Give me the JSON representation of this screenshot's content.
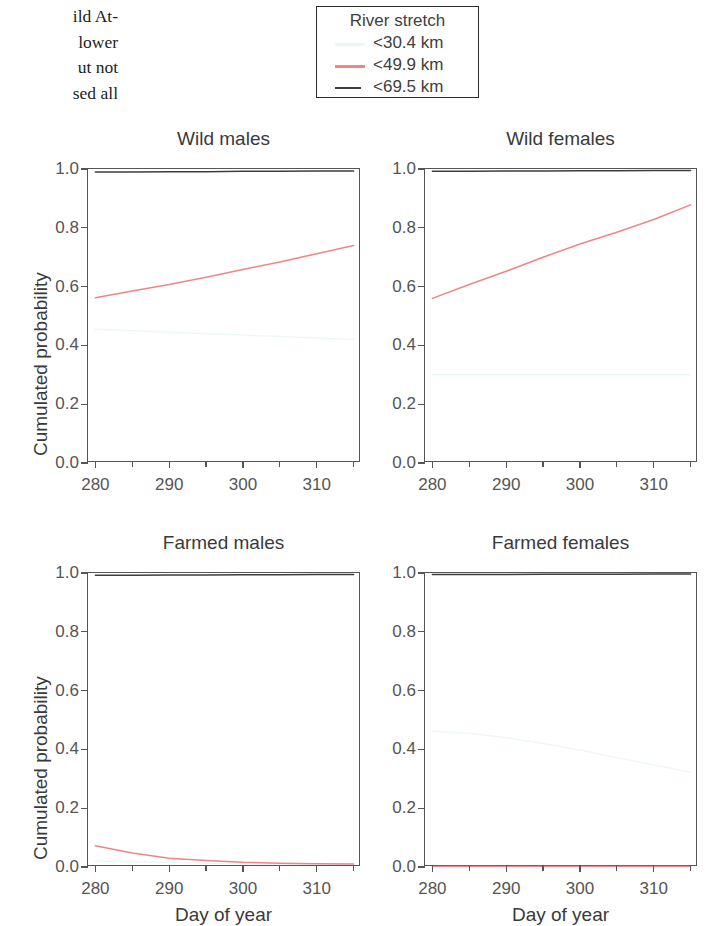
{
  "body_text": {
    "lines": [
      "ild At-",
      " lower",
      "ut not",
      "sed all"
    ]
  },
  "legend": {
    "title": "River stretch",
    "entries": [
      {
        "label": "<30.4 km",
        "style": "solid-faint",
        "color": "#eef7f6"
      },
      {
        "label": "<49.9 km",
        "style": "solid",
        "color": "#ec8785"
      },
      {
        "label": "<69.5 km",
        "style": "dashed",
        "color": "#3d3d3d"
      }
    ]
  },
  "axes": {
    "ylabel": "Cumulated probability",
    "xlabel": "Day of year",
    "yticks": [
      "1.0",
      "0.8",
      "0.6",
      "0.4",
      "0.2",
      "0.0"
    ],
    "ytick_values": [
      1.0,
      0.8,
      0.6,
      0.4,
      0.2,
      0.0
    ],
    "xticks": [
      "280",
      "290",
      "300",
      "310"
    ],
    "xtick_values": [
      280,
      290,
      300,
      310
    ],
    "xminor_values": [
      285,
      295,
      305,
      315
    ],
    "xlim": [
      279,
      316
    ],
    "ylim": [
      0.0,
      1.0
    ]
  },
  "chart_data": {
    "type": "line",
    "xlabel": "Day of year",
    "ylabel": "Cumulated probability",
    "xlim": [
      279,
      316
    ],
    "ylim": [
      0.0,
      1.0
    ],
    "grid": false,
    "legend_position": "top-center",
    "legend_title": "River stretch",
    "panels": [
      {
        "title": "Wild males",
        "series": [
          {
            "name": "<30.4 km",
            "color": "#eef7f6",
            "dash": "none",
            "x": [
              280,
              285,
              290,
              295,
              300,
              305,
              310,
              315
            ],
            "values": [
              0.455,
              0.45,
              0.445,
              0.44,
              0.435,
              0.43,
              0.425,
              0.42
            ]
          },
          {
            "name": "<49.9 km",
            "color": "#ec8785",
            "dash": "none",
            "x": [
              280,
              285,
              290,
              295,
              300,
              305,
              310,
              315
            ],
            "values": [
              0.562,
              0.585,
              0.607,
              0.632,
              0.658,
              0.684,
              0.712,
              0.74
            ]
          },
          {
            "name": "<69.5 km",
            "color": "#3d3d3d",
            "dash": "none",
            "x": [
              280,
              285,
              290,
              295,
              300,
              305,
              310,
              315
            ],
            "values": [
              0.99,
              0.99,
              0.991,
              0.991,
              0.992,
              0.992,
              0.993,
              0.993
            ]
          }
        ]
      },
      {
        "title": "Wild females",
        "series": [
          {
            "name": "<30.4 km",
            "color": "#eef7f6",
            "dash": "none",
            "x": [
              280,
              285,
              290,
              295,
              300,
              305,
              310,
              315
            ],
            "values": [
              0.3,
              0.3,
              0.3,
              0.3,
              0.3,
              0.3,
              0.3,
              0.3
            ]
          },
          {
            "name": "<49.9 km",
            "color": "#ec8785",
            "dash": "none",
            "x": [
              280,
              285,
              290,
              295,
              300,
              305,
              310,
              315
            ],
            "values": [
              0.56,
              0.607,
              0.652,
              0.7,
              0.745,
              0.785,
              0.828,
              0.878
            ]
          },
          {
            "name": "<69.5 km",
            "color": "#3d3d3d",
            "dash": "none",
            "x": [
              280,
              285,
              290,
              295,
              300,
              305,
              310,
              315
            ],
            "values": [
              0.992,
              0.992,
              0.993,
              0.993,
              0.994,
              0.994,
              0.995,
              0.995
            ]
          }
        ]
      },
      {
        "title": "Farmed males",
        "series": [
          {
            "name": "<30.4 km",
            "color": "#eef7f6",
            "dash": "none",
            "x": [
              280,
              285,
              290,
              295,
              300,
              305,
              310,
              315
            ],
            "values": [
              0.02,
              0.018,
              0.016,
              0.014,
              0.012,
              0.011,
              0.01,
              0.009
            ]
          },
          {
            "name": "<49.9 km",
            "color": "#ec8785",
            "dash": "none",
            "x": [
              280,
              285,
              290,
              295,
              300,
              305,
              310,
              315
            ],
            "values": [
              0.072,
              0.048,
              0.03,
              0.022,
              0.016,
              0.013,
              0.011,
              0.01
            ]
          },
          {
            "name": "<69.5 km",
            "color": "#3d3d3d",
            "dash": "none",
            "x": [
              280,
              285,
              290,
              295,
              300,
              305,
              310,
              315
            ],
            "values": [
              0.992,
              0.992,
              0.993,
              0.993,
              0.994,
              0.994,
              0.995,
              0.995
            ]
          }
        ]
      },
      {
        "title": "Farmed females",
        "series": [
          {
            "name": "<30.4 km",
            "color": "#eef7f6",
            "dash": "none",
            "x": [
              280,
              285,
              290,
              295,
              300,
              305,
              310,
              315
            ],
            "values": [
              0.462,
              0.455,
              0.44,
              0.42,
              0.398,
              0.372,
              0.348,
              0.322
            ]
          },
          {
            "name": "<49.9 km",
            "color": "#ec8785",
            "dash": "none",
            "x": [
              280,
              285,
              290,
              295,
              300,
              305,
              310,
              315
            ],
            "values": [
              0.002,
              0.002,
              0.002,
              0.002,
              0.002,
              0.002,
              0.002,
              0.002
            ]
          },
          {
            "name": "<69.5 km",
            "color": "#3d3d3d",
            "dash": "none",
            "x": [
              280,
              285,
              290,
              295,
              300,
              305,
              310,
              315
            ],
            "values": [
              0.995,
              0.995,
              0.995,
              0.996,
              0.996,
              0.996,
              0.997,
              0.997
            ]
          }
        ]
      }
    ]
  },
  "layout": {
    "panels": [
      {
        "box_x": 87,
        "box_y": 168,
        "box_w": 273,
        "box_h": 294,
        "title_y": 128,
        "show_ylabels": true,
        "show_xlabels": true,
        "show_ylabel": true,
        "show_xlabel": false
      },
      {
        "box_x": 424,
        "box_y": 168,
        "box_w": 273,
        "box_h": 294,
        "title_y": 128,
        "show_ylabels": true,
        "show_xlabels": true,
        "show_ylabel": false,
        "show_xlabel": false
      },
      {
        "box_x": 87,
        "box_y": 572,
        "box_w": 273,
        "box_h": 294,
        "title_y": 532,
        "show_ylabels": true,
        "show_xlabels": true,
        "show_ylabel": true,
        "show_xlabel": true
      },
      {
        "box_x": 424,
        "box_y": 572,
        "box_w": 273,
        "box_h": 294,
        "title_y": 532,
        "show_ylabels": true,
        "show_xlabels": true,
        "show_ylabel": false,
        "show_xlabel": true
      }
    ]
  }
}
